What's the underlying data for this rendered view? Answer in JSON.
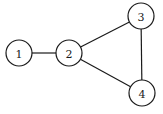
{
  "diagram": {
    "type": "undirected-graph",
    "node_radius": 13,
    "nodes": [
      {
        "id": "1",
        "label": "1",
        "x": 19,
        "y": 53
      },
      {
        "id": "2",
        "label": "2",
        "x": 69,
        "y": 53
      },
      {
        "id": "3",
        "label": "3",
        "x": 141,
        "y": 16
      },
      {
        "id": "4",
        "label": "4",
        "x": 142,
        "y": 93
      }
    ],
    "edges": [
      {
        "from": "1",
        "to": "2"
      },
      {
        "from": "2",
        "to": "3"
      },
      {
        "from": "2",
        "to": "4"
      },
      {
        "from": "3",
        "to": "4"
      }
    ],
    "colors": {
      "stroke": "#1a1a1a",
      "fill": "#ffffff",
      "background": "#ffffff"
    }
  }
}
